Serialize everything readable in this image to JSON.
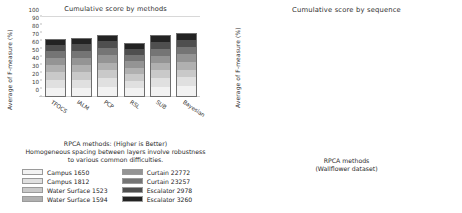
{
  "left": {
    "title": "Cumulative score by methods",
    "ylabel": "Average  of  F-measure  (%)",
    "caption_line1": "RPCA methods: (Higher is Better)",
    "caption_line2": "Homogeneous spacing between layers involve robustness",
    "caption_line3": "to various common difficulties.",
    "legend": [
      {
        "label": "Campus 1650",
        "color": "#f2f2f2"
      },
      {
        "label": "Campus 1812",
        "color": "#e0e0e0"
      },
      {
        "label": "Water Surface 1523",
        "color": "#c9c9c9"
      },
      {
        "label": "Water Surface 1594",
        "color": "#b0b0b0"
      },
      {
        "label": "Curtain 22772",
        "color": "#949494"
      },
      {
        "label": "Curtain 23257",
        "color": "#757575"
      },
      {
        "label": "Escalator 2978",
        "color": "#4f4f4f"
      },
      {
        "label": "Escalator 3260",
        "color": "#232323"
      }
    ]
  },
  "right": {
    "title": "Cumulative score by sequence",
    "ylabel": "Average  of  F-measure  (%)",
    "caption_line1": "RPCA methods",
    "caption_line2": "(Wallflower dataset)",
    "legend": [
      {
        "label": "TFOCS",
        "color": "#f2f2f2"
      },
      {
        "label": "IALM",
        "color": "#dcdcdc"
      },
      {
        "label": "PCP",
        "color": "#c0c0c0"
      },
      {
        "label": "RSL",
        "color": "#9a9a9a"
      },
      {
        "label": "SUB",
        "color": "#6d6d6d"
      },
      {
        "label": "Bayesian",
        "color": "#2b2b2b"
      }
    ]
  },
  "chart_data": [
    {
      "type": "bar",
      "stacked": true,
      "title": "Cumulative score by methods",
      "xlabel": "",
      "ylabel": "Average of F-measure (%)",
      "ylim": [
        0,
        100
      ],
      "yticks": [
        0,
        10,
        20,
        30,
        40,
        50,
        60,
        70,
        80,
        90,
        100
      ],
      "grid": true,
      "legend_position": "below",
      "categories": [
        "TFOCS",
        "IALM",
        "PCP",
        "RSL",
        "SUB",
        "Bayesian"
      ],
      "totals": [
        73,
        74,
        78,
        68,
        77,
        80
      ],
      "series": [
        {
          "name": "Campus 1650",
          "color": "#f2f2f2",
          "values": [
            11,
            11,
            12,
            10,
            12,
            13
          ]
        },
        {
          "name": "Campus 1812",
          "color": "#e0e0e0",
          "values": [
            10,
            10,
            11,
            9,
            11,
            11
          ]
        },
        {
          "name": "Water Surface 1523",
          "color": "#c9c9c9",
          "values": [
            10,
            10,
            10,
            9,
            10,
            10
          ]
        },
        {
          "name": "Water Surface 1594",
          "color": "#b0b0b0",
          "values": [
            9,
            9,
            10,
            9,
            10,
            10
          ]
        },
        {
          "name": "Curtain 22772",
          "color": "#949494",
          "values": [
            9,
            9,
            10,
            8,
            9,
            10
          ]
        },
        {
          "name": "Curtain 23257",
          "color": "#757575",
          "values": [
            9,
            9,
            9,
            8,
            9,
            9
          ]
        },
        {
          "name": "Escalator 2978",
          "color": "#4f4f4f",
          "values": [
            8,
            9,
            9,
            8,
            9,
            9
          ]
        },
        {
          "name": "Escalator 3260",
          "color": "#232323",
          "values": [
            7,
            7,
            7,
            7,
            7,
            8
          ]
        }
      ]
    },
    {
      "type": "bar",
      "stacked": true,
      "title": "Cumulative score by sequence",
      "xlabel": "",
      "ylabel": "Average of F-measure (%)",
      "ylim": [
        0,
        100
      ],
      "yticks": [
        0,
        10,
        20,
        30,
        40,
        50,
        60,
        70,
        80,
        90,
        100
      ],
      "grid": true,
      "legend_position": "below",
      "categories": [
        "Campus 1650",
        "Campus 1812",
        "Water Surface 1523",
        "Water Surface 1594",
        "Curtain 22772",
        "Curtain 23257",
        "Escalator 2978",
        "Escalator 3260"
      ],
      "totals": [
        64,
        84,
        82,
        55,
        91,
        80,
        79,
        61
      ],
      "series": [
        {
          "name": "TFOCS",
          "color": "#f2f2f2",
          "values": [
            11,
            15,
            14,
            9,
            16,
            14,
            14,
            11
          ]
        },
        {
          "name": "IALM",
          "color": "#dcdcdc",
          "values": [
            11,
            14,
            14,
            9,
            15,
            13,
            13,
            10
          ]
        },
        {
          "name": "PCP",
          "color": "#c0c0c0",
          "values": [
            11,
            14,
            14,
            9,
            15,
            13,
            13,
            10
          ]
        },
        {
          "name": "RSL",
          "color": "#9a9a9a",
          "values": [
            11,
            14,
            14,
            9,
            15,
            14,
            13,
            10
          ]
        },
        {
          "name": "SUB",
          "color": "#6d6d6d",
          "values": [
            10,
            14,
            13,
            9,
            15,
            13,
            13,
            10
          ]
        },
        {
          "name": "Bayesian",
          "color": "#2b2b2b",
          "values": [
            10,
            13,
            13,
            10,
            15,
            13,
            13,
            10
          ]
        }
      ]
    }
  ]
}
